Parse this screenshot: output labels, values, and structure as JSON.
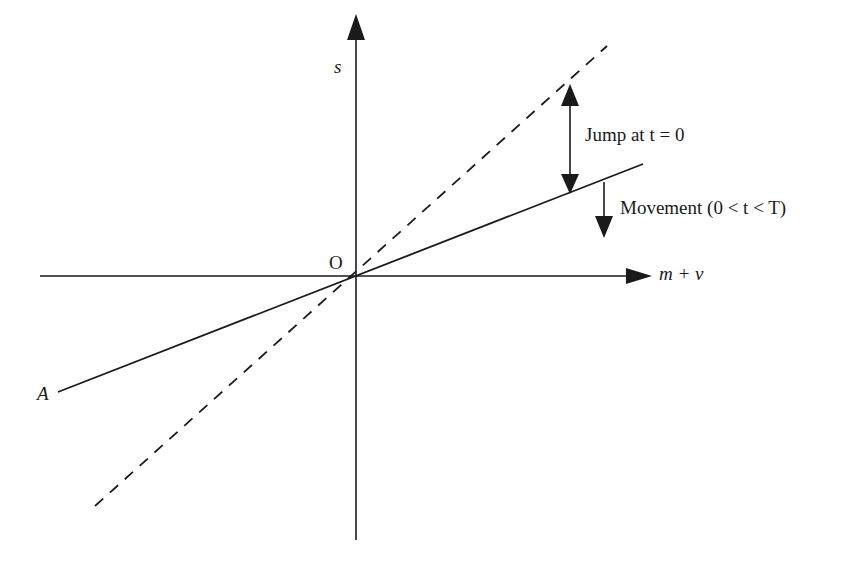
{
  "diagram": {
    "axes": {
      "x_label": "m + v",
      "y_label": "s",
      "origin_label": "O"
    },
    "lines": {
      "solid_line_label": "A",
      "dashed_line_label": ""
    },
    "annotations": {
      "jump": "Jump at t = 0",
      "movement": "Movement (0 < t < T)"
    },
    "colors": {
      "ink": "#1a1a1a",
      "background": "#ffffff"
    }
  }
}
